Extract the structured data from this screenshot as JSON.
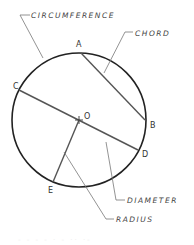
{
  "diagram": {
    "center_label": "O",
    "points": [
      "A",
      "B",
      "C",
      "D",
      "E"
    ],
    "terms": {
      "circumference": "CIRCUMFERENCE",
      "chord": "CHORD",
      "diameter": "DIAMETER",
      "radius": "RADIUS"
    },
    "caption": "- - - -  · -  ·· ·-"
  },
  "colors": {
    "circle": "#222222",
    "lines": "#555555",
    "leaders": "#777777",
    "text": "#333333"
  }
}
